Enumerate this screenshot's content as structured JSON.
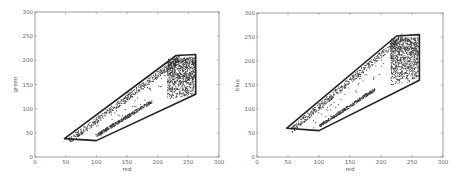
{
  "chart_data": [
    {
      "type": "scatter",
      "title": "",
      "xlabel": "red",
      "ylabel": "green",
      "xlim": [
        0,
        300
      ],
      "ylim": [
        0,
        300
      ],
      "xticks": [
        0,
        50,
        100,
        150,
        200,
        250,
        300
      ],
      "yticks": [
        0,
        50,
        100,
        150,
        200,
        250,
        300
      ],
      "grid": false,
      "boundary_polygon": [
        [
          48,
          38
        ],
        [
          100,
          34
        ],
        [
          262,
          130
        ],
        [
          262,
          212
        ],
        [
          230,
          210
        ]
      ],
      "point_cluster_description": "dense points along diagonal band from (50,40) to (260,210), densest near red 220-260, green 130-210"
    },
    {
      "type": "scatter",
      "title": "",
      "xlabel": "red",
      "ylabel": "blue",
      "xlim": [
        0,
        300
      ],
      "ylim": [
        0,
        300
      ],
      "xticks": [
        0,
        50,
        100,
        150,
        200,
        250,
        300
      ],
      "yticks": [
        0,
        50,
        100,
        150,
        200,
        250,
        300
      ],
      "grid": false,
      "boundary_polygon": [
        [
          48,
          60
        ],
        [
          100,
          55
        ],
        [
          262,
          160
        ],
        [
          262,
          255
        ],
        [
          225,
          252
        ]
      ],
      "point_cluster_description": "dense points along diagonal band from (50,60) to (260,255), densest near red 210-260, blue 160-255"
    }
  ],
  "plots": [
    {
      "xlabel": "red",
      "ylabel": "green"
    },
    {
      "xlabel": "red",
      "ylabel": "blue"
    }
  ],
  "tick_labels": [
    "0",
    "50",
    "100",
    "150",
    "200",
    "250",
    "300"
  ]
}
